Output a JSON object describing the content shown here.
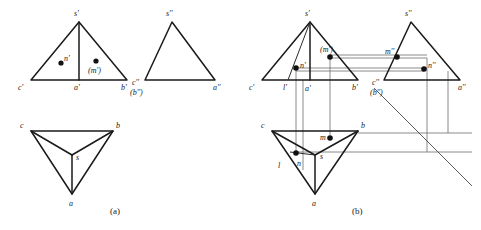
{
  "figure": {
    "captions": [
      {
        "id": "caption-a",
        "text": "(a)"
      },
      {
        "id": "caption-b",
        "text": "(b)"
      }
    ],
    "colors": {
      "outline": "#1a1a1a",
      "projection": "#6d6d6d",
      "miter": "#4a4a4a",
      "point": "#111111",
      "background": "#ffffff"
    }
  },
  "panel_a": {
    "name": "panel-a",
    "front_view": {
      "name": "front-view-a",
      "labels": {
        "apex": "s'",
        "left": "c'",
        "center": "a'",
        "right": "b'",
        "point_n": "n'",
        "point_m": "(m')"
      }
    },
    "side_view": {
      "name": "side-view-a",
      "labels": {
        "apex": "s''",
        "left_top": "c''",
        "left_bottom": "(b'')",
        "right": "a''"
      }
    },
    "top_view": {
      "name": "top-view-a",
      "labels": {
        "left": "c",
        "right": "b",
        "bottom": "a",
        "center": "s"
      }
    }
  },
  "panel_b": {
    "name": "panel-b",
    "front_view": {
      "name": "front-view-b",
      "labels": {
        "apex": "s'",
        "left": "c'",
        "center": "a'",
        "right": "b'",
        "point_n": "n'",
        "point_m": "(m')",
        "point_l": "l'"
      }
    },
    "side_view": {
      "name": "side-view-b",
      "labels": {
        "apex": "s''",
        "left_top": "c''",
        "left_bottom": "(b'')",
        "right": "a''",
        "point_m": "m''",
        "point_n": "n''"
      }
    },
    "top_view": {
      "name": "top-view-b",
      "labels": {
        "left": "c",
        "right": "b",
        "bottom": "a",
        "center": "s",
        "point_m": "m",
        "point_n": "n",
        "point_l": "l"
      }
    }
  }
}
